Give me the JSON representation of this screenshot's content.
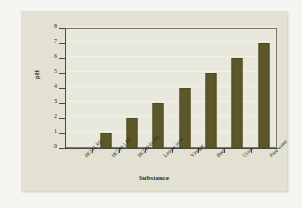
{
  "chart_data": {
    "type": "bar",
    "title": "",
    "xlabel": "Substance",
    "ylabel": "pH",
    "categories": [
      "HCl (1 M)",
      "HCl (0.1 M)",
      "HCl (0.01 M)",
      "Lemon juice",
      "Vinegar",
      "Beer",
      "Urine",
      "Pure water"
    ],
    "values": [
      0,
      1,
      2,
      3,
      4,
      5,
      6,
      7
    ],
    "ylim": [
      0,
      8
    ],
    "ytick_labels": [
      "0",
      "1",
      "2",
      "3",
      "4",
      "5",
      "6",
      "7",
      "8"
    ],
    "ytick_values": [
      0,
      1,
      2,
      3,
      4,
      5,
      6,
      7,
      8
    ],
    "grid": true,
    "legend": "none",
    "series": [
      {
        "name": "pH",
        "values": [
          0,
          1,
          2,
          3,
          4,
          5,
          6,
          7
        ]
      }
    ]
  },
  "colors": {
    "bar": "#5d5829",
    "bar_edge": "#4e4a22",
    "plot_background": "#e9e8dc",
    "card_background": "#e3e1d2",
    "page_background": "#f5f5f2",
    "axis": "#4a4a40",
    "gridline": "#f2f1e8",
    "text": "#1e1e18"
  }
}
